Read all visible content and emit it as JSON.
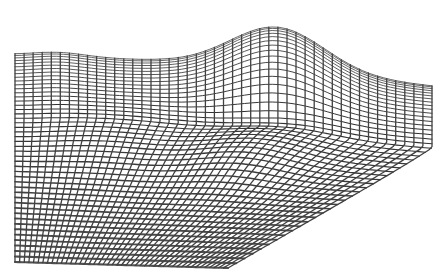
{
  "image": {
    "description": "3D wireframe mesh of an undulating surface with a raised ridge along the far edge and a shallow valley in the middle",
    "background_color": "#ffffff",
    "line_color": "#4a4a4a",
    "grid_rows": 46,
    "grid_cols": 46
  },
  "surface": {
    "corners": {
      "far_left": [
        15,
        48
      ],
      "far_right": [
        432,
        70
      ],
      "near_right": [
        432,
        150
      ],
      "near_left_bottom": [
        15,
        258
      ],
      "near_bottom_mid": [
        225,
        267
      ]
    },
    "peak": [
      275,
      10
    ],
    "valley_center": [
      250,
      115
    ]
  }
}
